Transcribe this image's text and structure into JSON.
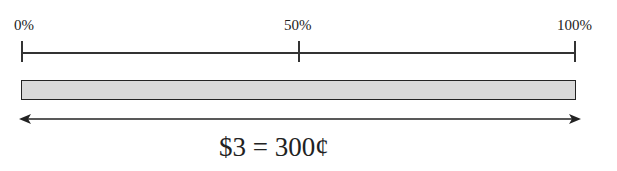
{
  "diagram": {
    "type": "percent-bar",
    "scale": {
      "ticks": [
        {
          "label": "0%",
          "position": 0
        },
        {
          "label": "50%",
          "position": 50
        },
        {
          "label": "100%",
          "position": 100
        }
      ]
    },
    "bar": {
      "fill_color": "#d8d8d8",
      "border_color": "#222222",
      "fill_percent": 100
    },
    "arrow": {
      "direction": "double-headed",
      "spans": "0% to 100%"
    },
    "caption": "$3 = 300¢"
  }
}
